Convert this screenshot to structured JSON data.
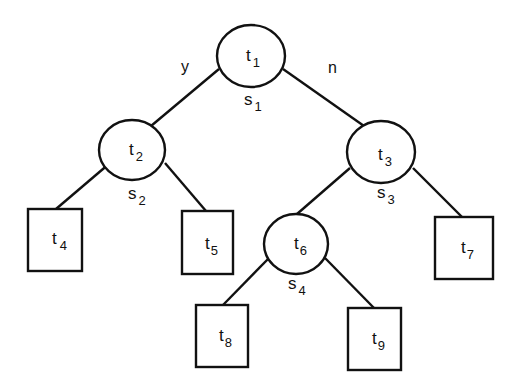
{
  "diagram": {
    "type": "binary decision tree",
    "nodes": [
      {
        "id": "t1",
        "label": "t",
        "sub": "1",
        "shape": "ellipse",
        "split": {
          "label": "s",
          "sub": "1"
        },
        "cx": 251,
        "cy": 56,
        "rx": 34,
        "ry": 31
      },
      {
        "id": "t2",
        "label": "t",
        "sub": "2",
        "shape": "ellipse",
        "split": {
          "label": "s",
          "sub": "2"
        },
        "cx": 132,
        "cy": 150,
        "rx": 33,
        "ry": 30
      },
      {
        "id": "t3",
        "label": "t",
        "sub": "3",
        "shape": "ellipse",
        "split": {
          "label": "s",
          "sub": "3"
        },
        "cx": 381,
        "cy": 152,
        "rx": 34,
        "ry": 31
      },
      {
        "id": "t4",
        "label": "t",
        "sub": "4",
        "shape": "rect",
        "x": 28,
        "y": 209,
        "w": 54,
        "h": 62
      },
      {
        "id": "t5",
        "label": "t",
        "sub": "5",
        "shape": "rect",
        "x": 182,
        "y": 211,
        "w": 51,
        "h": 63
      },
      {
        "id": "t6",
        "label": "t",
        "sub": "6",
        "shape": "ellipse",
        "split": {
          "label": "s",
          "sub": "4"
        },
        "cx": 296,
        "cy": 244,
        "rx": 32,
        "ry": 30
      },
      {
        "id": "t7",
        "label": "t",
        "sub": "7",
        "shape": "rect",
        "x": 435,
        "y": 217,
        "w": 58,
        "h": 62
      },
      {
        "id": "t8",
        "label": "t",
        "sub": "8",
        "shape": "rect",
        "x": 196,
        "y": 305,
        "w": 52,
        "h": 62
      },
      {
        "id": "t9",
        "label": "t",
        "sub": "9",
        "shape": "rect",
        "x": 348,
        "y": 308,
        "w": 53,
        "h": 62
      }
    ],
    "edges": [
      {
        "from": "t1",
        "to": "t2",
        "label": "y"
      },
      {
        "from": "t1",
        "to": "t3",
        "label": "n"
      },
      {
        "from": "t2",
        "to": "t4"
      },
      {
        "from": "t2",
        "to": "t5"
      },
      {
        "from": "t3",
        "to": "t6"
      },
      {
        "from": "t3",
        "to": "t7"
      },
      {
        "from": "t6",
        "to": "t8"
      },
      {
        "from": "t6",
        "to": "t9"
      }
    ],
    "edge_labels": {
      "yes": "y",
      "no": "n"
    },
    "colors": {
      "stroke": "#111111",
      "background": "#ffffff"
    }
  }
}
